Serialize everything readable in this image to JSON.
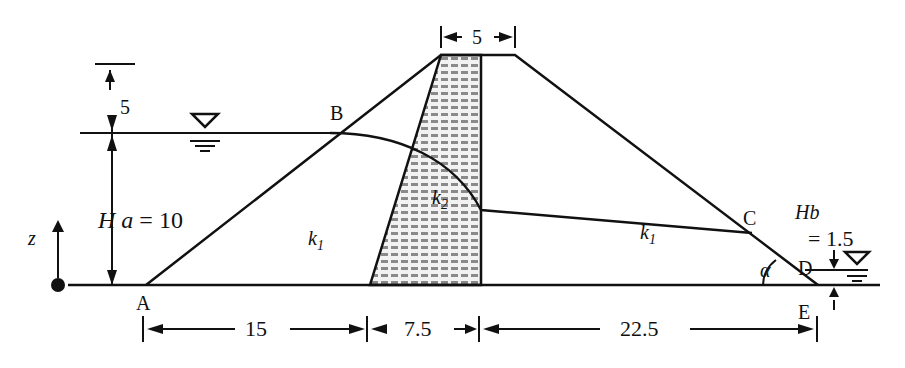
{
  "diagram": {
    "points": {
      "A": "A",
      "B": "B",
      "C": "C",
      "D": "D",
      "E": "E"
    },
    "zones": {
      "shell_left": "k",
      "shell_left_sub": "1",
      "core": "k",
      "core_sub": "2",
      "shell_right": "k",
      "shell_right_sub": "1"
    },
    "upstream": {
      "label_H": "H",
      "label_a": "a",
      "eq": "= 10",
      "freeboard": "5"
    },
    "downstream": {
      "label": "Hb",
      "eq": "= 1.5"
    },
    "crest_width": "5",
    "base_dims": {
      "left": "15",
      "core": "7.5",
      "right": "22.5"
    },
    "axis": {
      "z": "z"
    },
    "angle": "α",
    "colors": {
      "line": "#111111",
      "core_fill": "#e9e9e9",
      "core_hatch": "#555555"
    }
  }
}
